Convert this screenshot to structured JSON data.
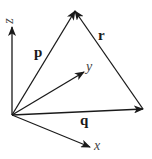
{
  "diagram": {
    "type": "vector-diagram",
    "origin": [
      12,
      115
    ],
    "vectors": [
      {
        "name": "p",
        "label": "p",
        "from": [
          12,
          115
        ],
        "to": [
          75,
          11
        ],
        "style": "bold"
      },
      {
        "name": "q",
        "label": "q",
        "from": [
          12,
          115
        ],
        "to": [
          143,
          109
        ],
        "style": "bold"
      },
      {
        "name": "r",
        "label": "r",
        "from": [
          143,
          109
        ],
        "to": [
          75,
          11
        ],
        "style": "bold"
      }
    ],
    "axes": [
      {
        "name": "x",
        "label": "x",
        "from": [
          12,
          115
        ],
        "to": [
          90,
          147
        ]
      },
      {
        "name": "y",
        "label": "y",
        "from": [
          12,
          115
        ],
        "to": [
          84,
          72
        ]
      },
      {
        "name": "z",
        "label": "z",
        "from": [
          12,
          115
        ],
        "to": [
          12,
          27
        ]
      }
    ],
    "labels": {
      "p": "p",
      "q": "q",
      "r": "r",
      "x": "x",
      "y": "y",
      "z": "z"
    },
    "colors": {
      "stroke": "#1a1a1a",
      "axis_label": "#444444"
    }
  }
}
